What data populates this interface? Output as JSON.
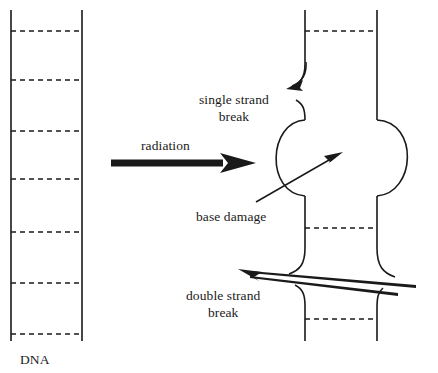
{
  "figure": {
    "background_color": "#ffffff",
    "line_color": "#1a1a1a"
  },
  "labels": {
    "dna": "DNA",
    "radiation": "radiation",
    "single_strand_break": "single strand\nbreak",
    "base_damage": "base damage",
    "double_strand_break": "double strand\nbreak"
  },
  "intact_dna": {
    "description": "Undamaged DNA double helix drawn as two parallel vertical strands joined by dashed base pairs",
    "left_strand_x": 11,
    "right_strand_x": 82,
    "strand_top_y": 10,
    "strand_bottom_y": 341,
    "base_pair_y": [
      31,
      80,
      131,
      179,
      232,
      283,
      334
    ],
    "base_pair_count": 7
  },
  "damaged_dna": {
    "description": "Irradiated DNA showing a single strand break, a base damage bubble, and a double strand break",
    "left_strand_x": 305,
    "right_strand_x": 377,
    "strand_top_y": 10,
    "strand_bottom_y": 341,
    "base_pair_y": [
      31,
      228,
      319
    ],
    "lesions": [
      {
        "name": "single-strand-break",
        "strand": "left",
        "gap_top_y": 88,
        "gap_bottom_y": 100
      },
      {
        "name": "base-damage-bubble",
        "top_y": 120,
        "bottom_y": 196,
        "left_extent_x": 267,
        "right_extent_x": 419
      },
      {
        "name": "double-strand-break",
        "gap_top_y": 272,
        "gap_bottom_y": 283,
        "strands": "both"
      }
    ]
  },
  "arrows": {
    "radiation": {
      "type": "thick-block-arrow",
      "x1": 111,
      "y1": 163,
      "x2": 256,
      "y2": 163
    },
    "single_strand_break_pointer": {
      "type": "curved-arrow",
      "points_to": "single-strand-break"
    },
    "base_damage_pointer": {
      "type": "straight-arrow",
      "points_to": "base-damage-bubble"
    },
    "double_strand_break_pointer": {
      "type": "long-wedge-arrow",
      "points_to": "double-strand-break"
    }
  }
}
